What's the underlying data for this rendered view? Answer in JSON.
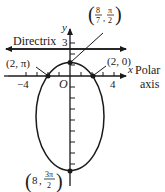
{
  "diagram": {
    "type": "polar conic (ellipse)",
    "axes": {
      "x_label": "x",
      "y_label": "y",
      "origin_label": "O",
      "polar_axis_label_line1": "Polar",
      "polar_axis_label_line2": "axis",
      "x_tick_labels": [
        "−4",
        "4"
      ],
      "y_tick_labels": [
        "3"
      ]
    },
    "directrix": {
      "label": "Directrix",
      "y_value": 4
    },
    "points": [
      {
        "id": "top-vertex",
        "label_r": "8",
        "label_r_den": "7",
        "label_theta": "π",
        "label_theta_den": "2",
        "display": "(8/7, π/2)"
      },
      {
        "id": "left-intercept",
        "display": "(2, π)"
      },
      {
        "id": "right-intercept",
        "display": "(2, 0)"
      },
      {
        "id": "bottom-vertex",
        "label_r": "8",
        "label_theta": "3π",
        "label_theta_den": "2",
        "display": "(8, 3π/2)"
      }
    ],
    "colors": {
      "stroke": "#1a1a1a",
      "background": "#ffffff"
    }
  }
}
